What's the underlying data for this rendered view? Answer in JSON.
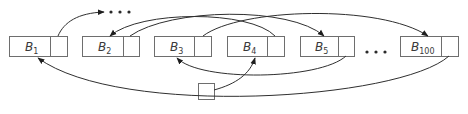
{
  "diagram": {
    "blocks": [
      {
        "id": "B1",
        "letter": "B",
        "subscript": "1",
        "x": 9,
        "data_w": 41,
        "ptr_w": 17
      },
      {
        "id": "B2",
        "letter": "B",
        "subscript": "2",
        "x": 82,
        "data_w": 41,
        "ptr_w": 16
      },
      {
        "id": "B3",
        "letter": "B",
        "subscript": "3",
        "x": 154,
        "data_w": 40,
        "ptr_w": 17
      },
      {
        "id": "B4",
        "letter": "B",
        "subscript": "4",
        "x": 227,
        "data_w": 40,
        "ptr_w": 17
      },
      {
        "id": "B5",
        "letter": "B",
        "subscript": "5",
        "x": 300,
        "data_w": 38,
        "ptr_w": 16
      },
      {
        "id": "B100",
        "letter": "B",
        "subscript": "100",
        "x": 400,
        "data_w": 41,
        "ptr_w": 17
      }
    ],
    "block_y": 36,
    "block_h": 20,
    "head_box": {
      "x": 198,
      "y": 83,
      "w": 16,
      "h": 16
    },
    "ellipses": [
      {
        "name": "top-ellipsis",
        "text": "• • •",
        "x": 106,
        "y": 12
      },
      {
        "name": "middle-ellipsis",
        "text": "• • •",
        "x": 366,
        "y": 52
      }
    ],
    "links": [
      {
        "from": "head",
        "to": "B4"
      },
      {
        "from": "B4",
        "to": "B2"
      },
      {
        "from": "B2",
        "to": "B5"
      },
      {
        "from": "B5",
        "to": "B3"
      },
      {
        "from": "B3",
        "to": "B100"
      },
      {
        "from": "B100",
        "to": "B1"
      },
      {
        "from": "B1",
        "to": "..."
      }
    ],
    "colors": {
      "stroke": "#2f2f2f",
      "box_border": "#6e6e6e",
      "text": "#3a3a3a"
    }
  }
}
